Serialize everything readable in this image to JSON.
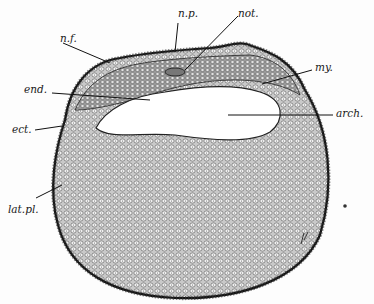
{
  "figure": {
    "labels": {
      "np": "n.p.",
      "not": "not.",
      "nf": "n.f.",
      "end": "end.",
      "my": "my.",
      "arch": "arch.",
      "ect": "ect.",
      "latpl": "lat.pl."
    },
    "signature": "pl",
    "colors": {
      "ink": "#1a1a1a",
      "cell_fill": "#e4e4e4",
      "background": "#fdfdfd"
    }
  }
}
